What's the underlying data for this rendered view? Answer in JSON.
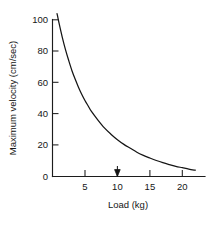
{
  "chart_data": {
    "type": "line",
    "title": "",
    "xlabel": "Load (kg)",
    "ylabel": "Maximum velocity (cm/sec)",
    "xlim": [
      0,
      23.5
    ],
    "ylim": [
      0,
      105
    ],
    "grid": false,
    "legend": null,
    "xticks": [
      5,
      10,
      15,
      20
    ],
    "xtick_labels": [
      "5",
      "10",
      "15",
      "20"
    ],
    "yticks": [
      0,
      20,
      40,
      60,
      80,
      100
    ],
    "ytick_labels": [
      "0",
      "20",
      "40",
      "60",
      "80",
      "100"
    ],
    "series": [
      {
        "name": "force-velocity curve",
        "x": [
          0.7,
          1.0,
          1.5,
          2.0,
          2.5,
          3.0,
          3.5,
          4.0,
          4.5,
          5.0,
          5.5,
          6.0,
          7.0,
          8.0,
          9.0,
          10.0,
          11.0,
          12.0,
          13.0,
          14.0,
          15.0,
          16.0,
          17.0,
          18.0,
          19.0,
          20.0,
          21.0,
          22.0
        ],
        "y": [
          104.0,
          98.0,
          89.0,
          81.0,
          74.0,
          67.5,
          62.0,
          57.0,
          52.5,
          48.5,
          45.0,
          41.5,
          36.0,
          31.0,
          27.0,
          23.5,
          20.5,
          18.0,
          15.5,
          13.5,
          11.8,
          10.2,
          8.8,
          7.6,
          6.5,
          5.6,
          4.7,
          4.0
        ]
      }
    ],
    "annotations": [
      {
        "name": "load-marker-arrow",
        "x": 10,
        "y": 0,
        "label": ""
      }
    ]
  },
  "axis_labels": {
    "x_title": "Load (kg)",
    "y_title": "Maximum velocity (cm/sec)"
  },
  "colors": {
    "curve": "#141414",
    "axis": "#1c1c1c",
    "text": "#161616",
    "background": "#ffffff"
  }
}
